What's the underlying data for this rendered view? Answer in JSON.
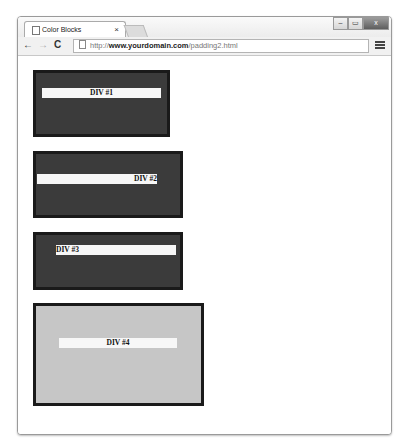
{
  "browser": {
    "tab_title": "Color Blocks",
    "tab_close": "×",
    "url_prefix": "http://",
    "url_domain": "www.yourdomain.com",
    "url_path": "/padding2.html",
    "nav": {
      "back": "←",
      "forward": "→",
      "reload": "C"
    },
    "window_controls": {
      "minimize": "–",
      "maximize": "▭",
      "close": "x"
    }
  },
  "page": {
    "divs": [
      {
        "label": "DIV #1",
        "style": "dark",
        "align": "center"
      },
      {
        "label": "DIV #2",
        "style": "dark",
        "align": "right"
      },
      {
        "label": "DIV #3",
        "style": "dark",
        "align": "left"
      },
      {
        "label": "DIV #4",
        "style": "light",
        "align": "center"
      }
    ],
    "colors": {
      "dark_fill": "#3b3b3b",
      "light_fill": "#c6c6c6",
      "border": "#1a1a1a",
      "bar": "#f7f7f7"
    }
  }
}
